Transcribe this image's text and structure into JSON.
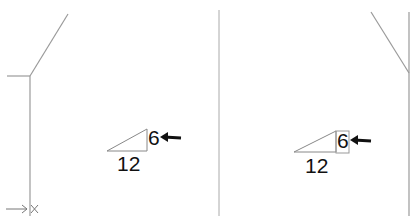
{
  "diagram": {
    "left_panel": {
      "pitch_run": "12",
      "pitch_rise": "6",
      "origin_marker": "×",
      "rise_highlighted": false
    },
    "right_panel": {
      "pitch_run": "12",
      "pitch_rise": "6",
      "rise_highlighted": true
    },
    "colors": {
      "line": "#9a9a9a",
      "text": "#111111",
      "arrow": "#111111"
    }
  }
}
